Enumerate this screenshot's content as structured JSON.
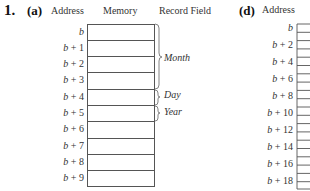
{
  "problem": {
    "number": "1.",
    "parts": [
      {
        "label": "(a)",
        "headers": {
          "address": "Address",
          "memory": "Memory",
          "record_field": "Record Field"
        },
        "rows": [
          {
            "base": "b",
            "offset": ""
          },
          {
            "base": "b",
            "offset": "+ 1"
          },
          {
            "base": "b",
            "offset": "+ 2"
          },
          {
            "base": "b",
            "offset": "+ 3"
          },
          {
            "base": "b",
            "offset": "+ 4"
          },
          {
            "base": "b",
            "offset": "+ 5"
          },
          {
            "base": "b",
            "offset": "+ 6"
          },
          {
            "base": "b",
            "offset": "+ 7"
          },
          {
            "base": "b",
            "offset": "+ 8"
          },
          {
            "base": "b",
            "offset": "+ 9"
          }
        ],
        "fields": [
          {
            "name": "Month",
            "rows": "b .. b+3"
          },
          {
            "name": "Day",
            "rows": "b+4"
          },
          {
            "name": "Year",
            "rows": "b+5"
          }
        ]
      },
      {
        "label": "(d)",
        "headers": {
          "address": "Address"
        },
        "rows": [
          {
            "base": "b",
            "offset": ""
          },
          {
            "base": "b",
            "offset": "+ 2"
          },
          {
            "base": "b",
            "offset": "+ 4"
          },
          {
            "base": "b",
            "offset": "+ 6"
          },
          {
            "base": "b",
            "offset": "+ 8"
          },
          {
            "base": "b",
            "offset": "+ 10"
          },
          {
            "base": "b",
            "offset": "+ 12"
          },
          {
            "base": "b",
            "offset": "+ 14"
          },
          {
            "base": "b",
            "offset": "+ 16"
          },
          {
            "base": "b",
            "offset": "+ 18"
          }
        ]
      }
    ]
  }
}
